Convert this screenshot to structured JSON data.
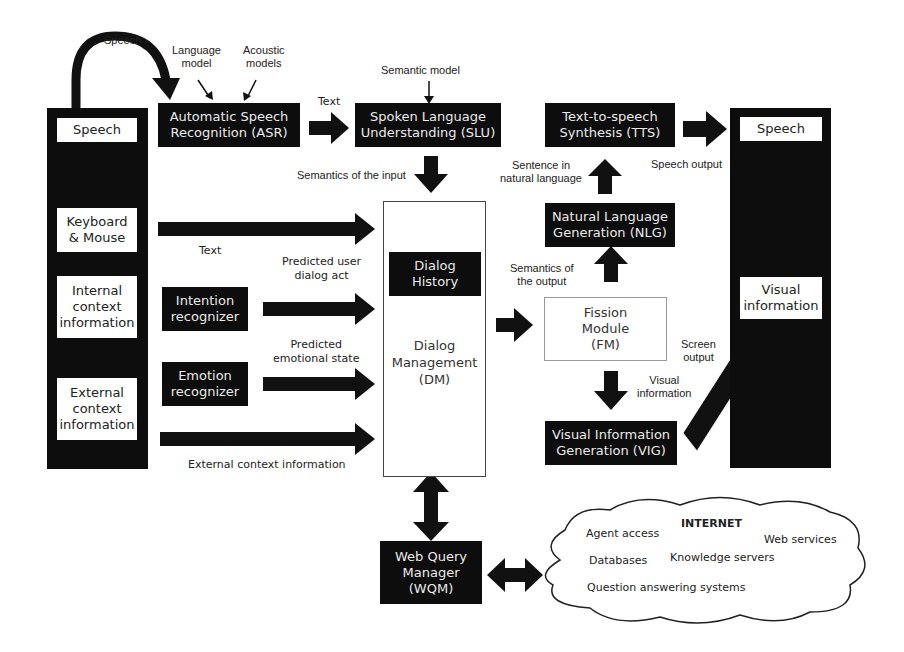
{
  "diagram": {
    "input_column": {
      "items": [
        {
          "label": "Speech"
        },
        {
          "label": "Keyboard\n& Mouse",
          "lines": [
            "Keyboard",
            "& Mouse"
          ]
        },
        {
          "label": "Internal context information",
          "lines": [
            "Internal",
            "context",
            "information"
          ]
        },
        {
          "label": "External context information",
          "lines": [
            "External",
            "context",
            "information"
          ]
        }
      ]
    },
    "output_column": {
      "items": [
        {
          "label": "Speech"
        },
        {
          "label": "Visual information",
          "lines": [
            "Visual",
            "information"
          ]
        }
      ]
    },
    "modules": {
      "asr": {
        "lines": [
          "Automatic Speech",
          "Recognition (ASR)"
        ]
      },
      "slu": {
        "lines": [
          "Spoken Language",
          "Understanding (SLU)"
        ]
      },
      "tts": {
        "lines": [
          "Text-to-speech",
          "Synthesis (TTS)"
        ]
      },
      "nlg": {
        "lines": [
          "Natural  Language",
          "Generation (NLG)"
        ]
      },
      "intention": {
        "lines": [
          "Intention",
          "recognizer"
        ]
      },
      "emotion": {
        "lines": [
          "Emotion",
          "recognizer"
        ]
      },
      "dialog_history": {
        "lines": [
          "Dialog",
          "History"
        ]
      },
      "dm": {
        "lines": [
          "Dialog",
          "Management",
          "(DM)"
        ]
      },
      "fm": {
        "lines": [
          "Fission",
          "Module",
          "(FM)"
        ]
      },
      "vig": {
        "lines": [
          "Visual Information",
          "Generation (VIG)"
        ]
      },
      "wqm": {
        "lines": [
          "Web Query",
          "Manager",
          "(WQM)"
        ]
      }
    },
    "labels": {
      "speech_loop": "Speech",
      "language_model": [
        "Language",
        "model"
      ],
      "acoustic_models": [
        "Acoustic",
        "models"
      ],
      "asr_to_slu": "Text",
      "semantic_model": "Semantic model",
      "semantics_input": "Semantics of the input",
      "keyboard_text": "Text",
      "predicted_user_act": [
        "Predicted user",
        "dialog act"
      ],
      "predicted_emotion": [
        "Predicted",
        "emotional state"
      ],
      "external_context": "External context information",
      "sentence_natural": [
        "Sentence in",
        "natural language"
      ],
      "speech_output": "Speech output",
      "semantics_output": [
        "Semantics of",
        "the output"
      ],
      "screen_output": [
        "Screen",
        "output"
      ],
      "visual_information": [
        "Visual",
        "information"
      ]
    },
    "internet": {
      "title": "INTERNET",
      "items": [
        "Agent access",
        "Web services",
        "Databases",
        "Knowledge servers",
        "Question answering systems"
      ]
    },
    "colors": {
      "block": "#0d0d0d",
      "block_text": "#eaeaea",
      "background": "#ffffff",
      "box_border": "#444444"
    }
  }
}
